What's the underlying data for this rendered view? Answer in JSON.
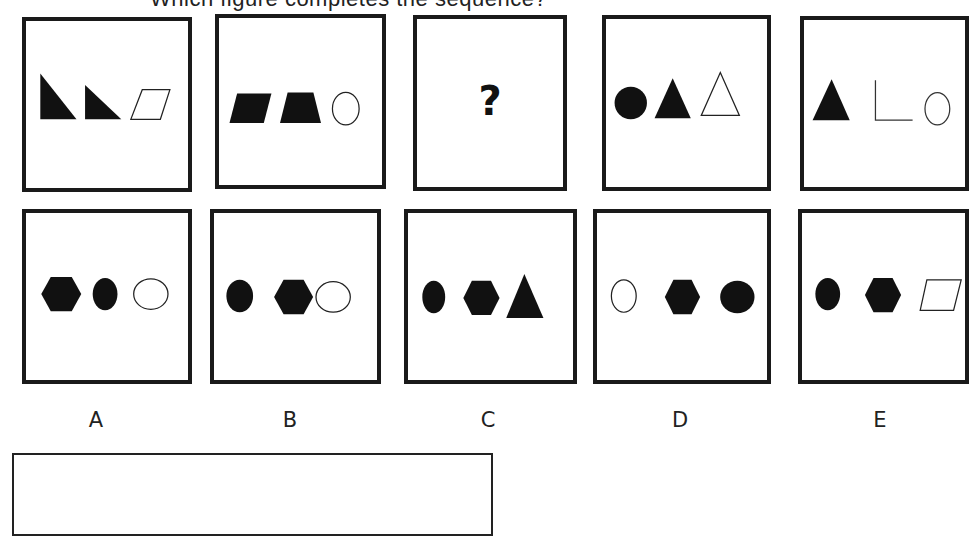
{
  "title_clipped": "Which figure completes the sequence?",
  "sequence": [
    {
      "id": "seq-1",
      "shapes": [
        "filled-right-triangle",
        "filled-right-triangle",
        "outline-parallelogram"
      ]
    },
    {
      "id": "seq-2",
      "shapes": [
        "filled-parallelogram",
        "filled-trapezoid",
        "outline-ellipse"
      ]
    },
    {
      "id": "seq-3",
      "placeholder": "?"
    },
    {
      "id": "seq-4",
      "shapes": [
        "filled-circle",
        "filled-triangle",
        "outline-triangle"
      ]
    },
    {
      "id": "seq-5",
      "shapes": [
        "filled-triangle",
        "outline-right-angle",
        "outline-ellipse"
      ]
    }
  ],
  "options": [
    {
      "label": "A",
      "shapes": [
        "filled-hexagon",
        "filled-ellipse",
        "outline-ellipse"
      ]
    },
    {
      "label": "B",
      "shapes": [
        "filled-ellipse",
        "filled-hexagon",
        "outline-ellipse"
      ]
    },
    {
      "label": "C",
      "shapes": [
        "filled-ellipse",
        "filled-hexagon",
        "filled-triangle"
      ]
    },
    {
      "label": "D",
      "shapes": [
        "outline-ellipse",
        "filled-hexagon",
        "filled-ellipse"
      ]
    },
    {
      "label": "E",
      "shapes": [
        "filled-ellipse",
        "filled-hexagon",
        "outline-parallelogram"
      ]
    }
  ],
  "answer": {
    "value": ""
  },
  "colors": {
    "ink": "#111111",
    "background": "#ffffff"
  }
}
